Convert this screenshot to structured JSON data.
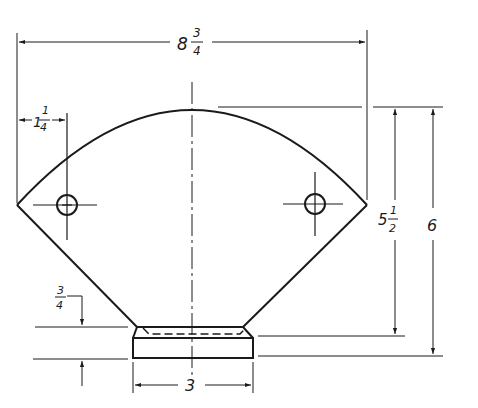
{
  "drawing": {
    "title": "Fan-shaped part with base (orthographic view)",
    "colors": {
      "line": "#1a1a1a",
      "background": "#ffffff"
    },
    "dimensions": {
      "overall_width": {
        "whole": "8",
        "num": "3",
        "den": "4"
      },
      "hole_offset": {
        "whole": "1",
        "num": "1",
        "den": "4"
      },
      "arc_height": {
        "whole": "5",
        "num": "1",
        "den": "2"
      },
      "overall_height": {
        "whole": "6"
      },
      "base_height": {
        "num": "3",
        "den": "4"
      },
      "base_width": {
        "whole": "3"
      }
    }
  }
}
